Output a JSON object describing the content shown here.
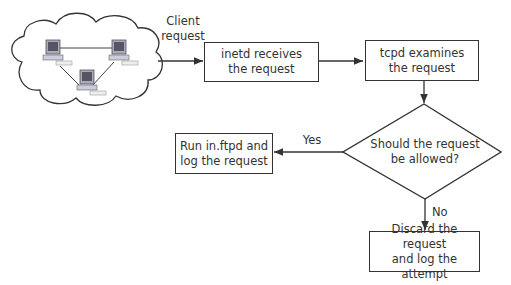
{
  "diagram": {
    "type": "flowchart",
    "network_cloud": {
      "icon": "network-cloud-icon",
      "computers": 3
    },
    "edges": {
      "client_request": {
        "label_line1": "Client",
        "label_line2": "request"
      },
      "yes": {
        "label": "Yes"
      },
      "no": {
        "label": "No"
      }
    },
    "nodes": {
      "inetd": {
        "line1": "inetd receives",
        "line2": "the request"
      },
      "tcpd": {
        "line1": "tcpd examines",
        "line2": "the request"
      },
      "decision": {
        "line1": "Should the request",
        "line2": "be allowed?"
      },
      "run": {
        "line1": "Run in.ftpd and",
        "line2": "log the request"
      },
      "discard": {
        "line1": "Discard the request",
        "line2": "and log the attempt"
      }
    },
    "colors": {
      "stroke": "#333333",
      "text": "#333333",
      "background": "#ffffff"
    }
  }
}
